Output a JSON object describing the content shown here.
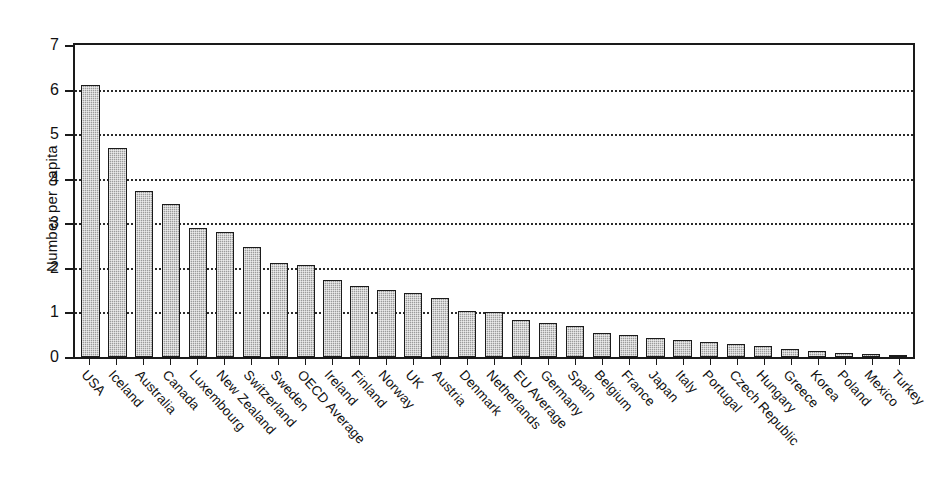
{
  "chart_data": {
    "type": "bar",
    "title": "",
    "xlabel": "",
    "ylabel": "Number per capita",
    "ylim": [
      0,
      7
    ],
    "yticks": [
      0,
      1,
      2,
      3,
      4,
      5,
      6,
      7
    ],
    "grid": "horizontal dotted gridlines at 1,2,3,4,5,6",
    "legend": "none",
    "bar_color": "#9b9b9b",
    "bar_edge_color": "#1b1b1b",
    "categories": [
      "USA",
      "Iceland",
      "Australia",
      "Canada",
      "Luxembourg",
      "New Zealand",
      "Switzerland",
      "Sweden",
      "OECD Average",
      "Ireland",
      "Finland",
      "Norway",
      "UK",
      "Austria",
      "Denmark",
      "Netherlands",
      "EU Average",
      "Germany",
      "Spain",
      "Belgium",
      "France",
      "Japan",
      "Italy",
      "Portugal",
      "Czech Republic",
      "Hungary",
      "Greece",
      "Korea",
      "Poland",
      "Mexico",
      "Turkey"
    ],
    "values": [
      6.1,
      4.7,
      3.73,
      3.43,
      2.9,
      2.81,
      2.47,
      2.12,
      2.07,
      1.73,
      1.6,
      1.5,
      1.44,
      1.33,
      1.04,
      1.0,
      0.82,
      0.76,
      0.7,
      0.55,
      0.5,
      0.43,
      0.38,
      0.34,
      0.3,
      0.24,
      0.19,
      0.14,
      0.08,
      0.06,
      0.05
    ]
  }
}
